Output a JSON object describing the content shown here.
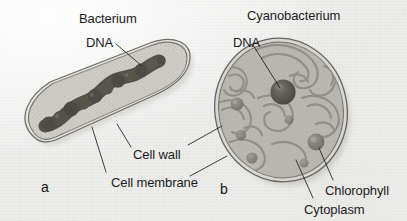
{
  "figure": {
    "kind": "biology-diagram",
    "background_color": "#f1f1ef",
    "ink_color": "#1c1c1c",
    "width": 407,
    "height": 221
  },
  "panels": [
    {
      "letter": "a",
      "letter_x": 41,
      "letter_y": 180,
      "title": "Bacterium",
      "title_x": 79,
      "title_y": 12,
      "cell_shape": "rod",
      "fill_color": "#c8c6c0",
      "outline_color": "#6e6c68"
    },
    {
      "letter": "b",
      "letter_x": 220,
      "letter_y": 182,
      "title": "Cyanobacterium",
      "title_x": 247,
      "title_y": 9,
      "cell_shape": "oval",
      "fill_color": "#b4b2ac",
      "outline_color": "#676563"
    }
  ],
  "labels": [
    {
      "id": "bacterium",
      "text": "Bacterium",
      "x": 79,
      "y": 12,
      "panel": "a"
    },
    {
      "id": "dna-a",
      "text": "DNA",
      "x": 86,
      "y": 36,
      "panel": "a"
    },
    {
      "id": "cyanobacterium",
      "text": "Cyanobacterium",
      "x": 247,
      "y": 9,
      "panel": "b"
    },
    {
      "id": "dna-b",
      "text": "DNA",
      "x": 233,
      "y": 36,
      "panel": "b"
    },
    {
      "id": "cell-wall",
      "text": "Cell wall",
      "x": 133,
      "y": 148,
      "panel": "both"
    },
    {
      "id": "cell-membrane",
      "text": "Cell membrane",
      "x": 111,
      "y": 176,
      "panel": "both"
    },
    {
      "id": "chlorophyll",
      "text": "Chlorophyll",
      "x": 325,
      "y": 184,
      "panel": "b"
    },
    {
      "id": "cytoplasm",
      "text": "Cytoplasm",
      "x": 304,
      "y": 203,
      "panel": "b"
    }
  ],
  "structures": {
    "bacterium": {
      "dna_description": "irregular lumpy dark nucleoid strand",
      "dna_color": "#4a4742",
      "cytoplasm_description": "fine stippled granular cytoplasm",
      "cytoplasm_color": "#cfcdc7"
    },
    "cyanobacterium": {
      "dna_description": "dark round nucleoid body",
      "dna_color": "#595650",
      "thylakoid_description": "concentric wavy photosynthetic membranes",
      "thylakoid_color": "#8d8b85",
      "granule_description": "chlorophyll-bearing granules",
      "granule_color": "#7d7b75"
    }
  }
}
